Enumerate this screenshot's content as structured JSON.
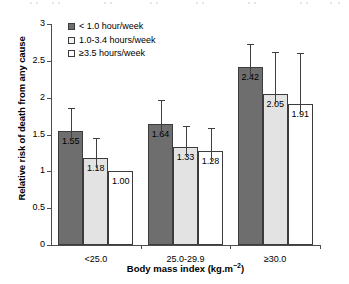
{
  "chart_data": {
    "type": "bar",
    "title": "",
    "subtitle": "",
    "xlabel_text": "Body mass index (kg.m",
    "xlabel_sup": "−2",
    "xlabel_tail": ")",
    "xlabel_full": "Body mass index (kg.m⁻²)",
    "ylabel": "Relative risk of death from any cause",
    "categories": [
      "<25.0",
      "25.0-29.9",
      "≥30.0"
    ],
    "ylim": [
      0,
      3
    ],
    "yticks": [
      0,
      0.5,
      1,
      1.5,
      2,
      2.5,
      3
    ],
    "ytick_labels": [
      "0",
      "0.5",
      "1",
      "1.5",
      "2",
      "2.5",
      "3"
    ],
    "grid": false,
    "legend_position": "top-left",
    "error_bars": "upper-only",
    "series": [
      {
        "name": "< 1.0 hour/week",
        "color": "#6e6e6e",
        "values": [
          1.55,
          1.18,
          2.42
        ],
        "value_labels": [
          "1.55",
          "1.18",
          "2.42"
        ],
        "error_upper": [
          1.86,
          1.45,
          2.73
        ]
      },
      {
        "name": "1.0-3.4 hours/week",
        "color": "#e3e3e3",
        "values": [
          1.18,
          1.33,
          2.05
        ],
        "value_labels": [
          "1.18",
          "1.33",
          "2.05"
        ],
        "error_upper": [
          1.45,
          1.62,
          2.62
        ]
      },
      {
        "name": "≥3.5 hours/week",
        "color": "#ffffff",
        "values": [
          1.0,
          1.28,
          1.91
        ],
        "value_labels": [
          "1.00",
          "1.28",
          "1.91"
        ],
        "error_upper": [
          null,
          1.59,
          2.6
        ]
      }
    ],
    "groups": [
      {
        "category": "<25.0",
        "bars": [
          {
            "series": "< 1.0 hour/week",
            "value": 1.55,
            "label": "1.55",
            "error_upper": 1.86
          },
          {
            "series": "1.0-3.4 hours/week",
            "value": 1.18,
            "label": "1.18",
            "error_upper": 1.45
          },
          {
            "series": "≥3.5 hours/week",
            "value": 1.0,
            "label": "1.00",
            "error_upper": null
          }
        ]
      },
      {
        "category": "25.0-29.9",
        "bars": [
          {
            "series": "< 1.0 hour/week",
            "value": 1.64,
            "label": "1.64",
            "error_upper": 1.97
          },
          {
            "series": "1.0-3.4 hours/week",
            "value": 1.33,
            "label": "1.33",
            "error_upper": 1.62
          },
          {
            "series": "≥3.5 hours/week",
            "value": 1.28,
            "label": "1.28",
            "error_upper": 1.59
          }
        ]
      },
      {
        "category": "≥30.0",
        "bars": [
          {
            "series": "< 1.0 hour/week",
            "value": 2.42,
            "label": "2.42",
            "error_upper": 2.73
          },
          {
            "series": "1.0-3.4 hours/week",
            "value": 2.05,
            "label": "2.05",
            "error_upper": 2.62
          },
          {
            "series": "≥3.5 hours/week",
            "value": 1.91,
            "label": "1.91",
            "error_upper": 2.6
          }
        ]
      }
    ]
  },
  "legend": {
    "items": [
      {
        "label": "< 1.0 hour/week",
        "swatch": "dark-gray"
      },
      {
        "label": "1.0-3.4 hours/week",
        "swatch": "light-gray"
      },
      {
        "label": "≥3.5 hours/week",
        "swatch": "white"
      }
    ]
  }
}
